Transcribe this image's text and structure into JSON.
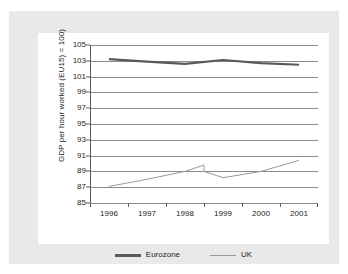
{
  "chart_data": {
    "type": "line",
    "title": "",
    "xlabel": "",
    "ylabel": "GDP per hour worked (EU15) = 100)",
    "categories": [
      "1996",
      "1997",
      "1998",
      "1999",
      "2000",
      "2001"
    ],
    "ylim": [
      85,
      105
    ],
    "ytick_step": 2,
    "yticks": [
      "105",
      "103",
      "101",
      "99",
      "97",
      "95",
      "93",
      "91",
      "89",
      "87",
      "85"
    ],
    "grid": true,
    "legend_position": "bottom-center",
    "series": [
      {
        "name": "Eurozone",
        "color": "#595959",
        "width": 2.2,
        "values": [
          103.2,
          102.9,
          102.6,
          103.1,
          102.7,
          102.5
        ]
      },
      {
        "name": "UK",
        "color": "#9a9a9a",
        "width": 1.0,
        "values": [
          87.1,
          88.0,
          89.0,
          88.2,
          89.0,
          90.4
        ]
      }
    ],
    "series_extra_points": {
      "UK": [
        {
          "after_index": 2,
          "offset": 0.5,
          "value": 89.8
        },
        {
          "after_index": 3,
          "offset": -0.5,
          "value": 89.0
        }
      ]
    }
  },
  "legend": {
    "items": [
      {
        "label": "Eurozone",
        "swatch": "eurozone"
      },
      {
        "label": "UK",
        "swatch": "uk"
      }
    ]
  },
  "colors": {
    "page_background": "#ffffff",
    "card_background": "#e9e9e9",
    "panel_background": "#ffffff",
    "gridline": "#8c8c8c",
    "axis": "#5a5a5a",
    "text": "#1c1c1c"
  }
}
